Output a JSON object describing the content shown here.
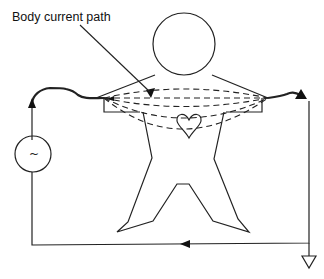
{
  "diagram": {
    "title_label": "Body current path",
    "source_symbol": "~",
    "elements": {
      "source": "AC voltage source",
      "ground": "ground symbol",
      "figure": "human body outline with heart",
      "paths": "dashed current paths across chest"
    },
    "colors": {
      "line": "#222222",
      "background": "#ffffff"
    }
  }
}
